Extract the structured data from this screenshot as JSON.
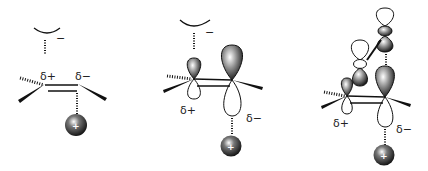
{
  "figure": {
    "type": "orbital-diagram",
    "panels": [
      {
        "id": "panel-1",
        "description": "alkene between anion (top) and cation (bottom), bond polarization",
        "labels": {
          "delta_plus": "δ+",
          "delta_minus": "δ−",
          "anion_charge": "−",
          "cation_charge": "+"
        }
      },
      {
        "id": "panel-2",
        "description": "polarized p-orbitals on alkene carbons",
        "labels": {
          "delta_plus": "δ+",
          "delta_minus": "δ−",
          "anion_charge": "−",
          "cation_charge": "+"
        }
      },
      {
        "id": "panel-3",
        "description": "orbital mixing with stacked p-orbitals (conjugation)",
        "labels": {
          "delta_plus": "δ+",
          "delta_minus": "δ−",
          "cation_charge": "+"
        }
      }
    ],
    "colors": {
      "ink": "#111111",
      "background": "#ffffff"
    }
  }
}
